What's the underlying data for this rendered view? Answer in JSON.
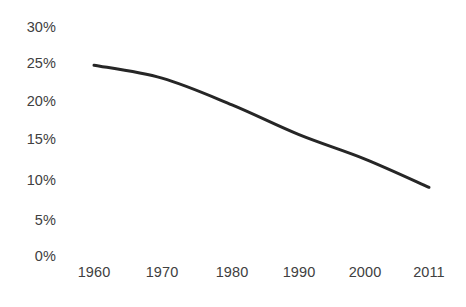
{
  "chart_data": {
    "type": "line",
    "title": "",
    "subtitle": "",
    "xlabel": "",
    "ylabel": "",
    "categories": [
      "1960",
      "1970",
      "1980",
      "1990",
      "2000",
      "2011"
    ],
    "x": [
      1960,
      1970,
      1980,
      1990,
      2000,
      2011
    ],
    "values": [
      25,
      23.3,
      19.8,
      15.9,
      12.7,
      9
    ],
    "series": [
      {
        "name": "",
        "values": [
          25,
          23.3,
          19.8,
          15.9,
          12.7,
          9
        ],
        "color": "#262626"
      }
    ],
    "ylim": [
      0,
      30
    ],
    "ytick_labels": [
      "30%",
      "25%",
      "20%",
      "15%",
      "10%",
      "5%",
      "0%"
    ],
    "ytick_values": [
      30,
      25,
      20,
      15,
      10,
      5,
      0
    ],
    "xtick_labels": [
      "1960",
      "1970",
      "1980",
      "1990",
      "2000",
      "2011"
    ],
    "grid": false,
    "legend": false,
    "legend_position": "none",
    "axis_lines": false,
    "annotations": []
  },
  "style": {
    "line_color": "#262626",
    "text_color": "#404040",
    "background_color": "#ffffff",
    "line_width": "3"
  },
  "geometry": {
    "ytick_pixels": [
      27,
      63,
      101,
      139,
      180,
      220,
      256
    ],
    "xtick_pixels": [
      94,
      162,
      232,
      299,
      365,
      429
    ],
    "point_pixels": [
      {
        "x": 94,
        "y": 64
      },
      {
        "x": 162,
        "y": 78
      },
      {
        "x": 232,
        "y": 105
      },
      {
        "x": 299,
        "y": 135
      },
      {
        "x": 365,
        "y": 159
      },
      {
        "x": 429,
        "y": 188
      }
    ]
  }
}
